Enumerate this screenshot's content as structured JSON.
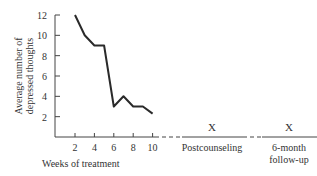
{
  "chart_data": {
    "type": "line",
    "title": "",
    "xlabel": "Weeks of treatment",
    "ylabel": "Average number of depressed thoughts",
    "ylabel_lines": [
      "Average number of",
      "depressed thoughts"
    ],
    "ylim": [
      0,
      12
    ],
    "yticks": [
      2,
      4,
      6,
      8,
      10,
      12
    ],
    "xticks": [
      2,
      4,
      6,
      8,
      10
    ],
    "grid": false,
    "series": [
      {
        "name": "Depressed thoughts",
        "x": [
          2,
          3,
          4,
          5,
          6,
          7,
          8,
          9,
          10
        ],
        "values": [
          12,
          10,
          9,
          9,
          3,
          4,
          3,
          3,
          2.3
        ]
      }
    ],
    "followup_points": [
      {
        "label": "Postcounseling",
        "marker": "X"
      },
      {
        "label": "6-month follow-up",
        "label_lines": [
          "6-month",
          "follow-up"
        ],
        "marker": "X"
      }
    ]
  }
}
